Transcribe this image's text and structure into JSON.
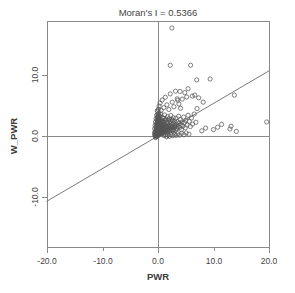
{
  "chart_data": {
    "type": "scatter",
    "title": "Moran's I = 0.5366",
    "moran_i": 0.5366,
    "xlabel": "PWR",
    "ylabel": "W_PWR",
    "xlim": [
      -20.0,
      20.0
    ],
    "ylim": [
      -13.0,
      18.5
    ],
    "xticks": [
      -20.0,
      -10.0,
      0.0,
      10.0,
      20.0
    ],
    "yticks": [
      10.0,
      0.0,
      -10.0
    ],
    "xtick_labels": [
      "-20.0",
      "-10.0",
      "0.0",
      "10.0",
      "20.0"
    ],
    "ytick_labels": [
      "10.0",
      "0.0",
      "-10.0"
    ],
    "grid": false,
    "legend": null,
    "reference_lines": {
      "vertical_x": 0.0,
      "horizontal_y": 0.0
    },
    "fit_line": {
      "slope": 0.5366,
      "intercept": 0.0,
      "x_start": -20.0,
      "x_end": 20.0,
      "y_start": -10.73,
      "y_end": 10.73
    },
    "marker": "open-circle",
    "marker_size": 2.1,
    "point_count": 268,
    "points": [
      [
        -0.55,
        0.1
      ],
      [
        -0.48,
        0.35
      ],
      [
        -0.42,
        -0.15
      ],
      [
        -0.38,
        0.55
      ],
      [
        -0.35,
        0.05
      ],
      [
        -0.32,
        0.8
      ],
      [
        -0.3,
        0.25
      ],
      [
        -0.28,
        1.1
      ],
      [
        -0.26,
        -0.05
      ],
      [
        -0.25,
        0.6
      ],
      [
        -0.22,
        1.45
      ],
      [
        -0.2,
        0.3
      ],
      [
        -0.19,
        0.95
      ],
      [
        -0.18,
        1.8
      ],
      [
        -0.16,
        0.45
      ],
      [
        -0.15,
        2.2
      ],
      [
        -0.14,
        0.15
      ],
      [
        -0.13,
        1.25
      ],
      [
        -0.12,
        0.7
      ],
      [
        -0.11,
        2.7
      ],
      [
        -0.1,
        0.4
      ],
      [
        -0.1,
        1.6
      ],
      [
        -0.09,
        0.9
      ],
      [
        -0.08,
        3.1
      ],
      [
        -0.08,
        0.2
      ],
      [
        -0.07,
        1.95
      ],
      [
        -0.06,
        0.55
      ],
      [
        -0.06,
        2.45
      ],
      [
        -0.05,
        1.15
      ],
      [
        -0.05,
        0.05
      ],
      [
        -0.04,
        3.55
      ],
      [
        -0.04,
        0.75
      ],
      [
        -0.03,
        1.7
      ],
      [
        -0.03,
        0.3
      ],
      [
        -0.02,
        2.1
      ],
      [
        -0.02,
        1.0
      ],
      [
        -0.01,
        4.05
      ],
      [
        -0.01,
        0.5
      ],
      [
        0.0,
        1.35
      ],
      [
        0.0,
        0.15
      ],
      [
        0.01,
        2.85
      ],
      [
        0.01,
        0.85
      ],
      [
        0.02,
        1.85
      ],
      [
        0.02,
        0.35
      ],
      [
        0.03,
        3.3
      ],
      [
        0.03,
        1.2
      ],
      [
        0.04,
        0.6
      ],
      [
        0.04,
        2.35
      ],
      [
        0.05,
        1.55
      ],
      [
        0.05,
        0.1
      ],
      [
        0.06,
        4.4
      ],
      [
        0.06,
        0.95
      ],
      [
        0.07,
        2.0
      ],
      [
        0.07,
        0.45
      ],
      [
        0.08,
        3.0
      ],
      [
        0.08,
        1.4
      ],
      [
        0.09,
        0.7
      ],
      [
        0.09,
        2.6
      ],
      [
        0.1,
        1.1
      ],
      [
        0.1,
        0.25
      ],
      [
        0.11,
        3.7
      ],
      [
        0.12,
        1.75
      ],
      [
        0.12,
        0.55
      ],
      [
        0.13,
        2.25
      ],
      [
        0.14,
        1.05
      ],
      [
        0.15,
        0.35
      ],
      [
        0.15,
        2.95
      ],
      [
        0.16,
        1.5
      ],
      [
        0.17,
        0.8
      ],
      [
        0.18,
        2.05
      ],
      [
        0.19,
        1.25
      ],
      [
        0.2,
        0.5
      ],
      [
        0.21,
        3.4
      ],
      [
        0.22,
        1.9
      ],
      [
        0.23,
        0.95
      ],
      [
        0.24,
        2.5
      ],
      [
        0.25,
        1.35
      ],
      [
        0.26,
        0.65
      ],
      [
        0.28,
        2.15
      ],
      [
        0.29,
        1.0
      ],
      [
        0.3,
        0.3
      ],
      [
        0.31,
        3.2
      ],
      [
        0.32,
        1.65
      ],
      [
        0.34,
        0.85
      ],
      [
        0.35,
        2.4
      ],
      [
        0.36,
        1.2
      ],
      [
        0.38,
        0.45
      ],
      [
        0.4,
        2.8
      ],
      [
        0.41,
        1.55
      ],
      [
        0.43,
        0.75
      ],
      [
        0.45,
        2.1
      ],
      [
        0.46,
        1.15
      ],
      [
        0.48,
        0.35
      ],
      [
        0.5,
        3.6
      ],
      [
        0.52,
        1.8
      ],
      [
        0.54,
        0.9
      ],
      [
        0.55,
        2.3
      ],
      [
        0.57,
        1.4
      ],
      [
        0.59,
        0.55
      ],
      [
        0.61,
        2.65
      ],
      [
        0.63,
        1.6
      ],
      [
        0.65,
        0.8
      ],
      [
        0.67,
        2.05
      ],
      [
        0.7,
        1.25
      ],
      [
        0.72,
        0.4
      ],
      [
        0.74,
        3.05
      ],
      [
        0.76,
        1.7
      ],
      [
        0.79,
        0.95
      ],
      [
        0.82,
        2.45
      ],
      [
        0.85,
        1.35
      ],
      [
        0.88,
        0.6
      ],
      [
        0.91,
        2.2
      ],
      [
        0.94,
        1.5
      ],
      [
        0.97,
        0.75
      ],
      [
        1.0,
        2.9
      ],
      [
        1.03,
        1.85
      ],
      [
        1.06,
        1.05
      ],
      [
        1.1,
        2.35
      ],
      [
        1.13,
        1.45
      ],
      [
        1.17,
        0.5
      ],
      [
        1.2,
        3.45
      ],
      [
        1.24,
        1.95
      ],
      [
        1.28,
        1.15
      ],
      [
        1.32,
        2.55
      ],
      [
        1.36,
        1.6
      ],
      [
        1.4,
        0.85
      ],
      [
        1.44,
        2.75
      ],
      [
        1.48,
        1.75
      ],
      [
        1.52,
        1.0
      ],
      [
        1.56,
        2.25
      ],
      [
        1.6,
        1.4
      ],
      [
        1.65,
        0.65
      ],
      [
        1.7,
        3.15
      ],
      [
        1.75,
        2.0
      ],
      [
        1.8,
        1.2
      ],
      [
        1.85,
        2.6
      ],
      [
        1.9,
        1.55
      ],
      [
        1.95,
        0.9
      ],
      [
        2.0,
        2.85
      ],
      [
        2.05,
        1.8
      ],
      [
        2.1,
        1.1
      ],
      [
        2.15,
        2.4
      ],
      [
        2.2,
        1.65
      ],
      [
        2.25,
        0.95
      ],
      [
        2.3,
        3.35
      ],
      [
        2.35,
        2.15
      ],
      [
        2.4,
        1.35
      ],
      [
        2.45,
        2.7
      ],
      [
        2.5,
        1.85
      ],
      [
        2.55,
        1.05
      ],
      [
        2.6,
        2.5
      ],
      [
        2.65,
        1.5
      ],
      [
        2.7,
        0.8
      ],
      [
        2.75,
        3.0
      ],
      [
        2.8,
        2.05
      ],
      [
        2.9,
        1.3
      ],
      [
        3.0,
        2.45
      ],
      [
        3.05,
        1.6
      ],
      [
        3.1,
        0.95
      ],
      [
        3.2,
        2.9
      ],
      [
        3.3,
        1.95
      ],
      [
        3.4,
        1.25
      ],
      [
        3.5,
        2.35
      ],
      [
        3.6,
        1.55
      ],
      [
        3.7,
        3.25
      ],
      [
        3.8,
        2.1
      ],
      [
        3.9,
        1.4
      ],
      [
        4.0,
        2.7
      ],
      [
        4.1,
        1.75
      ],
      [
        4.2,
        1.05
      ],
      [
        4.3,
        2.3
      ],
      [
        4.45,
        1.6
      ],
      [
        4.6,
        3.1
      ],
      [
        4.75,
        2.2
      ],
      [
        4.9,
        1.35
      ],
      [
        5.0,
        2.55
      ],
      [
        5.2,
        1.8
      ],
      [
        5.4,
        3.4
      ],
      [
        5.6,
        2.4
      ],
      [
        5.8,
        1.55
      ],
      [
        6.0,
        2.95
      ],
      [
        6.2,
        1.95
      ],
      [
        6.5,
        3.6
      ],
      [
        6.8,
        2.25
      ],
      [
        7.0,
        4.5
      ],
      [
        0.2,
        4.9
      ],
      [
        0.35,
        5.4
      ],
      [
        0.55,
        4.2
      ],
      [
        0.75,
        5.9
      ],
      [
        1.05,
        4.65
      ],
      [
        1.3,
        6.35
      ],
      [
        1.6,
        5.1
      ],
      [
        1.95,
        4.35
      ],
      [
        2.2,
        6.9
      ],
      [
        2.55,
        5.55
      ],
      [
        2.85,
        4.8
      ],
      [
        3.15,
        7.35
      ],
      [
        3.45,
        6.1
      ],
      [
        3.75,
        5.25
      ],
      [
        4.05,
        4.55
      ],
      [
        2.5,
        17.7
      ],
      [
        2.2,
        11.6
      ],
      [
        5.85,
        11.6
      ],
      [
        6.95,
        9.2
      ],
      [
        9.35,
        9.35
      ],
      [
        5.4,
        7.75
      ],
      [
        6.6,
        6.7
      ],
      [
        7.3,
        6.25
      ],
      [
        8.1,
        5.55
      ],
      [
        6.15,
        6.55
      ],
      [
        4.8,
        7.1
      ],
      [
        5.15,
        6.4
      ],
      [
        3.95,
        7.3
      ],
      [
        4.35,
        6.05
      ],
      [
        3.55,
        5.85
      ],
      [
        13.7,
        6.7
      ],
      [
        11.4,
        1.9
      ],
      [
        12.9,
        1.15
      ],
      [
        13.1,
        1.6
      ],
      [
        14.05,
        0.75
      ],
      [
        19.5,
        2.3
      ],
      [
        9.95,
        1.05
      ],
      [
        8.55,
        1.3
      ],
      [
        7.85,
        0.85
      ],
      [
        10.7,
        1.45
      ],
      [
        1.1,
        0.05
      ],
      [
        1.35,
        0.2
      ],
      [
        1.55,
        -0.1
      ],
      [
        1.75,
        0.15
      ],
      [
        2.05,
        -0.05
      ],
      [
        2.35,
        0.25
      ],
      [
        2.65,
        0.05
      ],
      [
        2.95,
        0.3
      ],
      [
        3.25,
        0.1
      ],
      [
        3.55,
        0.35
      ],
      [
        3.85,
        0.15
      ],
      [
        4.25,
        0.45
      ],
      [
        4.65,
        0.2
      ],
      [
        5.05,
        0.5
      ],
      [
        5.55,
        0.3
      ],
      [
        -0.6,
        1.2
      ],
      [
        -0.58,
        0.65
      ],
      [
        -0.52,
        1.75
      ],
      [
        -0.45,
        2.3
      ],
      [
        -0.4,
        1.4
      ],
      [
        -0.34,
        2.85
      ],
      [
        -0.29,
        1.95
      ],
      [
        -0.24,
        3.4
      ],
      [
        -0.17,
        2.55
      ],
      [
        -0.12,
        4.15
      ],
      [
        -0.62,
        0.4
      ],
      [
        -0.5,
        0.15
      ],
      [
        -0.44,
        -0.25
      ],
      [
        -0.36,
        0.9
      ],
      [
        -0.27,
        0.05
      ],
      [
        0.15,
        1.05
      ],
      [
        0.27,
        1.45
      ],
      [
        0.37,
        0.7
      ],
      [
        0.47,
        1.3
      ],
      [
        0.58,
        0.85
      ],
      [
        0.68,
        1.6
      ],
      [
        0.78,
        1.1
      ],
      [
        0.89,
        0.55
      ],
      [
        0.99,
        1.7
      ],
      [
        1.12,
        0.95
      ],
      [
        1.26,
        1.25
      ],
      [
        1.42,
        0.7
      ],
      [
        1.58,
        1.45
      ],
      [
        1.72,
        0.95
      ],
      [
        1.88,
        1.3
      ],
      [
        2.12,
        0.75
      ],
      [
        2.42,
        1.5
      ],
      [
        2.72,
        1.0
      ],
      [
        3.02,
        1.7
      ],
      [
        3.35,
        1.15
      ]
    ]
  },
  "plot_geometry": {
    "frame_left": 47,
    "frame_right": 270,
    "frame_top": 21,
    "frame_bottom": 248,
    "x_zero_px": 158,
    "y_zero_px": 136,
    "px_per_x_unit": 5.575,
    "px_per_y_unit": 6.1
  }
}
